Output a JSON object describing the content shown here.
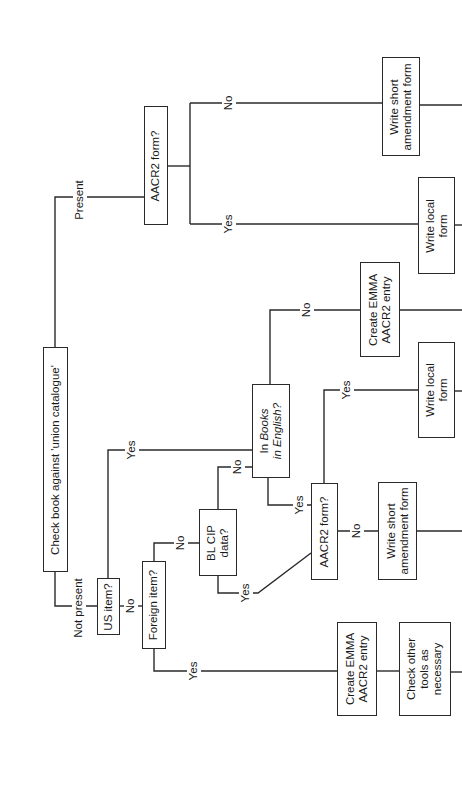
{
  "diagram": {
    "type": "flowchart",
    "orientation": "rotated-90-ccw",
    "nodes": {
      "check_union": {
        "label": "Check book against 'union catalogue'"
      },
      "aacr2_top": {
        "label": "AACR2 form?"
      },
      "write_short_top": {
        "line1": "Write short",
        "line2": "amendment form"
      },
      "write_local_top": {
        "line1": "Write local",
        "line2": "form"
      },
      "create_emma_mid": {
        "line1": "Create EMMA",
        "line2": "AACR2 entry"
      },
      "write_local_mid": {
        "line1": "Write local",
        "line2": "form"
      },
      "us_item": {
        "label": "US item?"
      },
      "foreign_item": {
        "label": "Foreign item?"
      },
      "bl_cip": {
        "line1": "BL CIP",
        "line2": "data?"
      },
      "books_in_english": {
        "line1_prefix": "In ",
        "line1_italic": "Books",
        "line2_italic": "in English?"
      },
      "aacr2_lower": {
        "label": "AACR2 form?"
      },
      "write_short_lower": {
        "line1": "Write short",
        "line2": "amendment form"
      },
      "create_emma_bottom": {
        "line1": "Create EMMA",
        "line2": "AACR2 entry"
      },
      "check_other_tools": {
        "line1": "Check other",
        "line2": "tools as",
        "line3": "necessary"
      }
    },
    "edge_labels": {
      "present": "Present",
      "not_present": "Not present",
      "aacr2_top_no": "No",
      "aacr2_top_yes": "Yes",
      "us_yes": "Yes",
      "us_no": "No",
      "foreign_no": "No",
      "foreign_yes": "Yes",
      "bl_cip_no": "No",
      "bl_cip_yes": "Yes",
      "bie_no": "No",
      "bie_yes": "Yes",
      "aacr2_lower_yes": "Yes",
      "aacr2_lower_no": "No"
    },
    "edges": [
      [
        "check_union",
        "aacr2_top",
        "Present"
      ],
      [
        "check_union",
        "us_item",
        "Not present"
      ],
      [
        "aacr2_top",
        "write_short_top",
        "No"
      ],
      [
        "aacr2_top",
        "write_local_top",
        "Yes"
      ],
      [
        "us_item",
        "books_in_english",
        "Yes"
      ],
      [
        "us_item",
        "foreign_item",
        "No"
      ],
      [
        "foreign_item",
        "bl_cip",
        "No"
      ],
      [
        "foreign_item",
        "create_emma_bottom",
        "Yes"
      ],
      [
        "bl_cip",
        "books_in_english",
        "No"
      ],
      [
        "bl_cip",
        "aacr2_lower",
        "Yes"
      ],
      [
        "books_in_english",
        "create_emma_mid",
        "No"
      ],
      [
        "books_in_english",
        "aacr2_lower",
        "Yes"
      ],
      [
        "aacr2_lower",
        "write_local_mid",
        "Yes"
      ],
      [
        "aacr2_lower",
        "write_short_lower",
        "No"
      ],
      [
        "create_emma_bottom",
        "check_other_tools",
        ""
      ]
    ]
  }
}
